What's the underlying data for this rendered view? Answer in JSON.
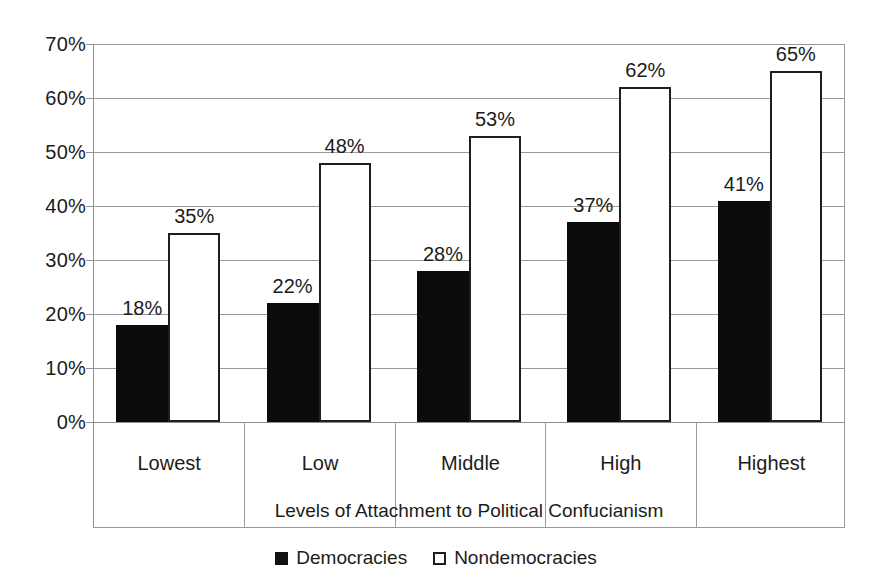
{
  "chart_data": {
    "type": "bar",
    "title": "",
    "xlabel": "Levels of Attachment to Political Confucianism",
    "ylabel": "",
    "categories": [
      "Lowest",
      "Low",
      "Middle",
      "High",
      "Highest"
    ],
    "series": [
      {
        "name": "Democracies",
        "values": [
          18,
          22,
          28,
          37,
          41
        ],
        "labels": [
          "18%",
          "22%",
          "28%",
          "37%",
          "41%"
        ],
        "fill": "#0b0b0b",
        "stroke": "#0b0b0b"
      },
      {
        "name": "Nondemocracies",
        "values": [
          35,
          48,
          53,
          62,
          65
        ],
        "labels": [
          "35%",
          "48%",
          "53%",
          "62%",
          "65%"
        ],
        "fill": "#ffffff",
        "stroke": "#1f1f1f"
      }
    ],
    "ylim": [
      0,
      70
    ],
    "ytick_values": [
      0,
      10,
      20,
      30,
      40,
      50,
      60,
      70
    ],
    "ytick_labels": [
      "0%",
      "10%",
      "20%",
      "30%",
      "40%",
      "50%",
      "60%",
      "70%"
    ],
    "grid": true,
    "legend_position": "bottom",
    "value_labels_shown": true
  },
  "axis": {
    "x_title": "Levels of Attachment to Political Confucianism",
    "tick_labels": [
      "70%",
      "60%",
      "50%",
      "40%",
      "30%",
      "20%",
      "10%",
      "0%"
    ]
  },
  "categories": [
    "Lowest",
    "Low",
    "Middle",
    "High",
    "Highest"
  ],
  "legend": {
    "items": [
      {
        "label": "Democracies",
        "marker": "filled-square-icon"
      },
      {
        "label": "Nondemocracies",
        "marker": "hollow-square-icon"
      }
    ]
  },
  "colors": {
    "democracies": "#0b0b0b",
    "nondemocracies": "#ffffff",
    "bar_outline": "#1f1f1f",
    "gridline": "#9a9a9a",
    "axis": "#8f8f8f",
    "text": "#1c1c1c",
    "background": "#ffffff"
  }
}
